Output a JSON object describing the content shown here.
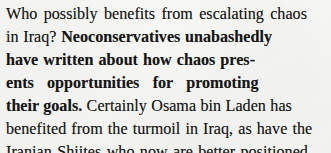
{
  "document": {
    "type": "scanned-print-excerpt",
    "background_color": "#f6f6f4",
    "ink_color": "#161616",
    "full_text": "Who possibly benefits from escalating chaos in Iraq? Neoconservatives unabashedly have written about how chaos presents opportunities for promoting their goals. Certainly Osama bin Laden has benefited from the turmoil in Iraq, as have the Iranian Shiites who now are better positioned",
    "lines": [
      {
        "index": 1,
        "segments": [
          {
            "text": "Who possibly benefits from escalating chaos",
            "weight": "regular"
          }
        ]
      },
      {
        "index": 2,
        "segments": [
          {
            "text": "in Iraq? ",
            "weight": "regular"
          },
          {
            "text": "Neoconservatives unabashedly",
            "weight": "bold"
          }
        ]
      },
      {
        "index": 3,
        "segments": [
          {
            "text": "have written about how chaos pres-",
            "weight": "bold"
          }
        ]
      },
      {
        "index": 4,
        "segments": [
          {
            "text": "ents opportunities for promoting",
            "weight": "bold"
          }
        ]
      },
      {
        "index": 5,
        "segments": [
          {
            "text": "their goals.",
            "weight": "bold"
          },
          {
            "text": " Certainly Osama bin Laden has",
            "weight": "regular"
          }
        ]
      },
      {
        "index": 6,
        "segments": [
          {
            "text": "benefited from the turmoil in Iraq, as have the",
            "weight": "regular"
          }
        ]
      },
      {
        "index": 7,
        "segments": [
          {
            "text": "Iranian Shiites who now are better positioned",
            "weight": "regular"
          }
        ]
      }
    ]
  }
}
